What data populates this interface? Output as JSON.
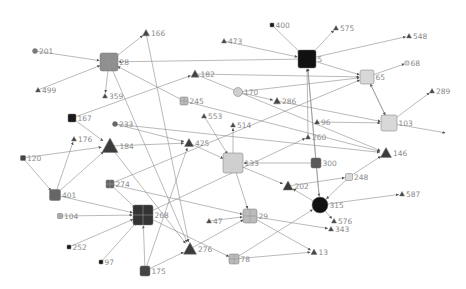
{
  "diagram": {
    "type": "directed-network-graph",
    "background": "#ffffff",
    "edge_color": "#8c8c8c",
    "label_color": "#8a8a8a",
    "nodes": [
      {
        "id": "5",
        "shape": "square",
        "x": 307,
        "y": 59,
        "size": 18,
        "fill": "#111111"
      },
      {
        "id": "400",
        "shape": "square",
        "x": 272,
        "y": 25,
        "size": 4,
        "fill": "#1a1a1a"
      },
      {
        "id": "575",
        "shape": "triangle",
        "x": 336,
        "y": 28,
        "size": 5,
        "fill": "#444444"
      },
      {
        "id": "473",
        "shape": "triangle",
        "x": 224,
        "y": 41,
        "size": 5,
        "fill": "#444444"
      },
      {
        "id": "548",
        "shape": "triangle",
        "x": 409,
        "y": 36,
        "size": 5,
        "fill": "#444444"
      },
      {
        "id": "68",
        "shape": "square",
        "x": 407,
        "y": 63,
        "size": 4,
        "fill": "#dddddd"
      },
      {
        "id": "65",
        "shape": "square",
        "x": 367,
        "y": 77,
        "size": 14,
        "fill": "#d8d8d8"
      },
      {
        "id": "289",
        "shape": "triangle",
        "x": 432,
        "y": 91,
        "size": 5,
        "fill": "#444444"
      },
      {
        "id": "103",
        "shape": "square",
        "x": 389,
        "y": 123,
        "size": 16,
        "fill": "#d8d8d8"
      },
      {
        "id": "28",
        "shape": "grid",
        "x": 109,
        "y": 62,
        "size": 18,
        "fill": "#8f8f8f"
      },
      {
        "id": "166",
        "shape": "triangle",
        "x": 146,
        "y": 33,
        "size": 7,
        "fill": "#444444"
      },
      {
        "id": "201",
        "shape": "circle",
        "x": 35,
        "y": 51,
        "size": 5,
        "fill": "#7a7a7a"
      },
      {
        "id": "499",
        "shape": "triangle",
        "x": 38,
        "y": 90,
        "size": 5,
        "fill": "#444444"
      },
      {
        "id": "359",
        "shape": "triangle",
        "x": 105,
        "y": 96,
        "size": 5,
        "fill": "#444444"
      },
      {
        "id": "182",
        "shape": "triangle",
        "x": 195,
        "y": 74,
        "size": 8,
        "fill": "#444444"
      },
      {
        "id": "170",
        "shape": "circle",
        "x": 238,
        "y": 92,
        "size": 9,
        "fill": "#cfcfcf"
      },
      {
        "id": "286",
        "shape": "triangle",
        "x": 277,
        "y": 101,
        "size": 7,
        "fill": "#444444"
      },
      {
        "id": "245",
        "shape": "grid",
        "x": 184,
        "y": 101,
        "size": 8,
        "fill": "#bbbbbb"
      },
      {
        "id": "553",
        "shape": "triangle",
        "x": 204,
        "y": 116,
        "size": 5,
        "fill": "#444444"
      },
      {
        "id": "514",
        "shape": "triangle",
        "x": 233,
        "y": 125,
        "size": 5,
        "fill": "#444444"
      },
      {
        "id": "96",
        "shape": "triangle",
        "x": 317,
        "y": 122,
        "size": 5,
        "fill": "#444444"
      },
      {
        "id": "260",
        "shape": "triangle",
        "x": 308,
        "y": 137,
        "size": 5,
        "fill": "#444444"
      },
      {
        "id": "167",
        "shape": "square",
        "x": 72,
        "y": 118,
        "size": 8,
        "fill": "#1a1a1a"
      },
      {
        "id": "233",
        "shape": "circle",
        "x": 115,
        "y": 124,
        "size": 5,
        "fill": "#666666"
      },
      {
        "id": "176",
        "shape": "triangle",
        "x": 74,
        "y": 139,
        "size": 5,
        "fill": "#444444"
      },
      {
        "id": "184",
        "shape": "triangle",
        "x": 110,
        "y": 146,
        "size": 16,
        "fill": "#3c3c3c"
      },
      {
        "id": "425",
        "shape": "triangle",
        "x": 189,
        "y": 143,
        "size": 9,
        "fill": "#3c3c3c"
      },
      {
        "id": "133",
        "shape": "square",
        "x": 233,
        "y": 163,
        "size": 20,
        "fill": "#cfcfcf"
      },
      {
        "id": "146",
        "shape": "triangle",
        "x": 386,
        "y": 153,
        "size": 11,
        "fill": "#3c3c3c"
      },
      {
        "id": "300",
        "shape": "square",
        "x": 316,
        "y": 163,
        "size": 10,
        "fill": "#5a5a5a"
      },
      {
        "id": "248",
        "shape": "square",
        "x": 349,
        "y": 177,
        "size": 7,
        "fill": "#d8d8d8"
      },
      {
        "id": "202",
        "shape": "triangle",
        "x": 288,
        "y": 186,
        "size": 10,
        "fill": "#3c3c3c"
      },
      {
        "id": "315",
        "shape": "circle",
        "x": 320,
        "y": 205,
        "size": 16,
        "fill": "#111111"
      },
      {
        "id": "587",
        "shape": "triangle",
        "x": 402,
        "y": 194,
        "size": 5,
        "fill": "#444444"
      },
      {
        "id": "576",
        "shape": "triangle",
        "x": 334,
        "y": 221,
        "size": 5,
        "fill": "#444444"
      },
      {
        "id": "343",
        "shape": "triangle",
        "x": 331,
        "y": 229,
        "size": 5,
        "fill": "#444444"
      },
      {
        "id": "120",
        "shape": "square",
        "x": 23,
        "y": 158,
        "size": 5,
        "fill": "#444444"
      },
      {
        "id": "401",
        "shape": "square",
        "x": 55,
        "y": 195,
        "size": 11,
        "fill": "#666666"
      },
      {
        "id": "274",
        "shape": "grid",
        "x": 110,
        "y": 184,
        "size": 8,
        "fill": "#666666"
      },
      {
        "id": "268",
        "shape": "grid",
        "x": 143,
        "y": 215,
        "size": 20,
        "fill": "#333333"
      },
      {
        "id": "104",
        "shape": "square",
        "x": 60,
        "y": 216,
        "size": 5,
        "fill": "#aaaaaa"
      },
      {
        "id": "252",
        "shape": "square",
        "x": 69,
        "y": 247,
        "size": 4,
        "fill": "#1a1a1a"
      },
      {
        "id": "97",
        "shape": "square",
        "x": 101,
        "y": 262,
        "size": 4,
        "fill": "#1a1a1a"
      },
      {
        "id": "175",
        "shape": "square",
        "x": 145,
        "y": 271,
        "size": 10,
        "fill": "#444444"
      },
      {
        "id": "276",
        "shape": "triangle",
        "x": 190,
        "y": 249,
        "size": 13,
        "fill": "#3c3c3c"
      },
      {
        "id": "47",
        "shape": "triangle",
        "x": 209,
        "y": 221,
        "size": 5,
        "fill": "#444444"
      },
      {
        "id": "29",
        "shape": "grid",
        "x": 250,
        "y": 216,
        "size": 14,
        "fill": "#bbbbbb"
      },
      {
        "id": "78",
        "shape": "grid",
        "x": 234,
        "y": 259,
        "size": 10,
        "fill": "#bbbbbb"
      },
      {
        "id": "13",
        "shape": "triangle",
        "x": 314,
        "y": 252,
        "size": 6,
        "fill": "#444444"
      }
    ],
    "edges": [
      [
        "400",
        "5"
      ],
      [
        "5",
        "575"
      ],
      [
        "473",
        "5"
      ],
      [
        "5",
        "548"
      ],
      [
        "5",
        "65"
      ],
      [
        "5",
        "28"
      ],
      [
        "65",
        "68"
      ],
      [
        "170",
        "65"
      ],
      [
        "182",
        "65"
      ],
      [
        "103",
        "65"
      ],
      [
        "65",
        "103"
      ],
      [
        "103",
        "289"
      ],
      [
        "96",
        "103"
      ],
      [
        "286",
        "103"
      ],
      [
        "103",
        "end-arrow"
      ],
      [
        "28",
        "166"
      ],
      [
        "201",
        "28"
      ],
      [
        "499",
        "28"
      ],
      [
        "28",
        "359"
      ],
      [
        "245",
        "28"
      ],
      [
        "167",
        "182"
      ],
      [
        "170",
        "286"
      ],
      [
        "182",
        "146"
      ],
      [
        "245",
        "146"
      ],
      [
        "133",
        "514"
      ],
      [
        "553",
        "133"
      ],
      [
        "425",
        "133"
      ],
      [
        "300",
        "133"
      ],
      [
        "133",
        "29"
      ],
      [
        "133",
        "202"
      ],
      [
        "233",
        "425"
      ],
      [
        "184",
        "425"
      ],
      [
        "167",
        "184"
      ],
      [
        "120",
        "184"
      ],
      [
        "401",
        "184"
      ],
      [
        "401",
        "176"
      ],
      [
        "120",
        "401"
      ],
      [
        "401",
        "268"
      ],
      [
        "104",
        "268"
      ],
      [
        "252",
        "268"
      ],
      [
        "97",
        "268"
      ],
      [
        "175",
        "268"
      ],
      [
        "274",
        "268"
      ],
      [
        "268",
        "260"
      ],
      [
        "175",
        "276"
      ],
      [
        "175",
        "425"
      ],
      [
        "166",
        "276"
      ],
      [
        "184",
        "276"
      ],
      [
        "28",
        "276"
      ],
      [
        "47",
        "29"
      ],
      [
        "29",
        "343"
      ],
      [
        "29",
        "13"
      ],
      [
        "276",
        "29"
      ],
      [
        "78",
        "13"
      ],
      [
        "78",
        "315"
      ],
      [
        "315",
        "576"
      ],
      [
        "315",
        "587"
      ],
      [
        "315",
        "202"
      ],
      [
        "300",
        "315"
      ],
      [
        "248",
        "146"
      ],
      [
        "248",
        "315"
      ],
      [
        "202",
        "248"
      ],
      [
        "300",
        "5"
      ],
      [
        "315",
        "5"
      ],
      [
        "274",
        "29"
      ],
      [
        "274",
        "65"
      ],
      [
        "233",
        "146"
      ],
      [
        "268",
        "78"
      ],
      [
        "260",
        "5"
      ]
    ]
  }
}
